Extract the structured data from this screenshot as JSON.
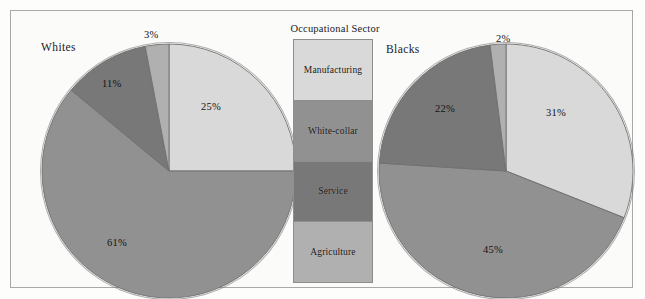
{
  "figure": {
    "legend": {
      "title": "Occupational Sector",
      "items": [
        {
          "label": "Manufacturing",
          "color": "#d9d9d9"
        },
        {
          "label": "White-collar",
          "color": "#919191"
        },
        {
          "label": "Service",
          "color": "#787878"
        },
        {
          "label": "Agriculture",
          "color": "#b0b0b0"
        }
      ]
    },
    "charts": [
      {
        "title": "Whites",
        "labels": [
          "25%",
          "61%",
          "11%",
          "3%"
        ]
      },
      {
        "title": "Blacks",
        "labels": [
          "31%",
          "45%",
          "22%",
          "2%"
        ]
      }
    ]
  },
  "chart_data": [
    {
      "type": "pie",
      "title": "Whites",
      "categories": [
        "Manufacturing",
        "White-collar",
        "Service",
        "Agriculture"
      ],
      "values": [
        25,
        61,
        11,
        3
      ],
      "value_labels": [
        "25%",
        "61%",
        "11%",
        "3%"
      ],
      "colors": [
        "#d9d9d9",
        "#919191",
        "#787878",
        "#b0b0b0"
      ],
      "units": "percent",
      "start_angle_deg": 0,
      "direction": "clockwise",
      "legend": "shared-center",
      "grid": false
    },
    {
      "type": "pie",
      "title": "Blacks",
      "categories": [
        "Manufacturing",
        "White-collar",
        "Service",
        "Agriculture"
      ],
      "values": [
        31,
        45,
        22,
        2
      ],
      "value_labels": [
        "31%",
        "45%",
        "22%",
        "2%"
      ],
      "colors": [
        "#d9d9d9",
        "#919191",
        "#787878",
        "#b0b0b0"
      ],
      "units": "percent",
      "start_angle_deg": 0,
      "direction": "clockwise",
      "legend": "shared-center",
      "grid": false
    }
  ]
}
